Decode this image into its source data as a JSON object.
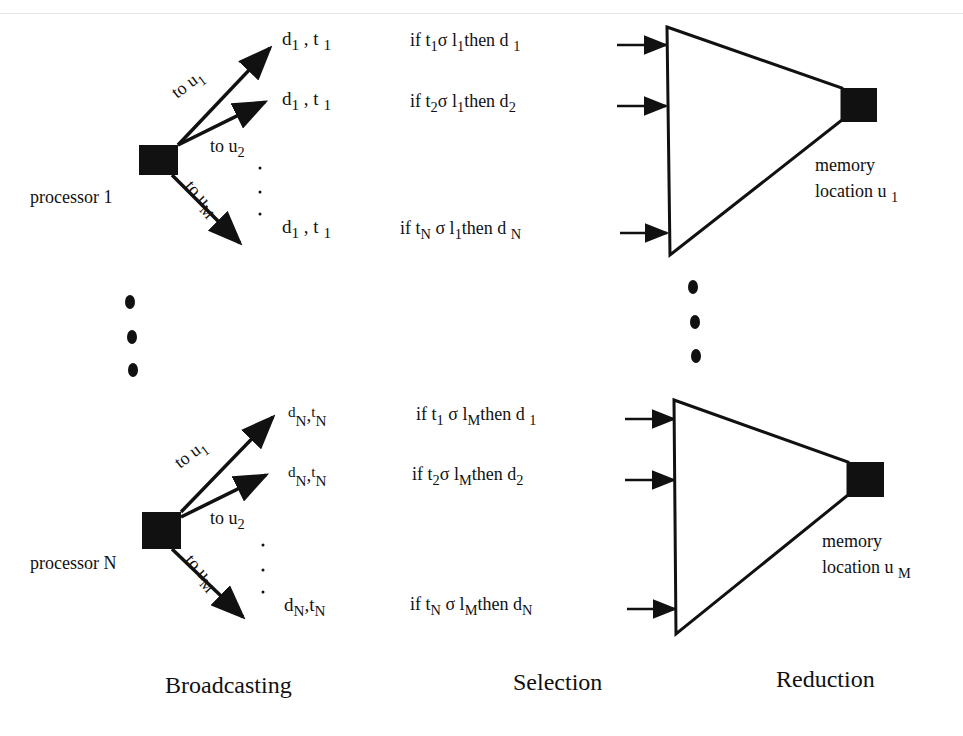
{
  "stages": {
    "broadcasting": "Broadcasting",
    "selection": "Selection",
    "reduction": "Reduction"
  },
  "processors": [
    {
      "label": "processor 1",
      "arrows": [
        {
          "to": "to u",
          "sub": "1"
        },
        {
          "to": "to u",
          "sub": "2"
        },
        {
          "to": "to u",
          "sub": "M"
        }
      ],
      "messages": [
        {
          "d": "d",
          "d_sub": "1",
          "t": "t",
          "t_sub": "1"
        },
        {
          "d": "d",
          "d_sub": "1",
          "t": "t",
          "t_sub": "1"
        },
        {
          "d": "d",
          "d_sub": "1",
          "t": "t",
          "t_sub": "1"
        }
      ],
      "selections": [
        {
          "if": "if t",
          "t_sub": "1",
          "sigma": "σ l",
          "l_sub": "1",
          "then": "then d",
          "d_sub": "1"
        },
        {
          "if": "if t",
          "t_sub": "2",
          "sigma": "σ l",
          "l_sub": "1",
          "then": "then d",
          "d_sub": "2"
        },
        {
          "if": "if t",
          "t_sub": "N",
          "sigma": "σ l",
          "l_sub": "1",
          "then": "then d",
          "d_sub": "N"
        }
      ],
      "memory": {
        "line1": "memory",
        "line2": "location u",
        "sub": "1"
      }
    },
    {
      "label": "processor N",
      "arrows": [
        {
          "to": "to u",
          "sub": "1"
        },
        {
          "to": "to u",
          "sub": "2"
        },
        {
          "to": "to u",
          "sub": "M"
        }
      ],
      "messages": [
        {
          "d": "d",
          "d_sub": "N",
          "t": "t",
          "t_sub": "N"
        },
        {
          "d": "d",
          "d_sub": "N",
          "t": "t",
          "t_sub": "N"
        },
        {
          "d": "d",
          "d_sub": "N",
          "t": "t",
          "t_sub": "N"
        }
      ],
      "selections": [
        {
          "if": "if t",
          "t_sub": "1",
          "sigma": "σ l",
          "l_sub": "M",
          "then": "then d",
          "d_sub": "1"
        },
        {
          "if": "if t",
          "t_sub": "2",
          "sigma": "σ l",
          "l_sub": "M",
          "then": "then d",
          "d_sub": "2"
        },
        {
          "if": "if t",
          "t_sub": "N",
          "sigma": "σ l",
          "l_sub": "M",
          "then": "then d",
          "d_sub": "N"
        }
      ],
      "memory": {
        "line1": "memory",
        "line2": "location u",
        "sub": "M"
      }
    }
  ],
  "separator": ",",
  "ellipsis_dot": "."
}
